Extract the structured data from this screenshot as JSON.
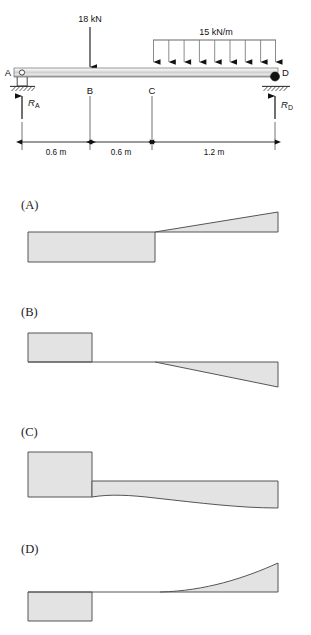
{
  "figure": {
    "type": "beam-shear-diagram-multiple-choice",
    "beam": {
      "nodes": [
        {
          "id": "A",
          "label": "A",
          "x_px": 16,
          "support": "pin"
        },
        {
          "id": "B",
          "label": "B",
          "x_px": 90,
          "support": "none"
        },
        {
          "id": "C",
          "label": "C",
          "x_px": 152,
          "support": "none"
        },
        {
          "id": "D",
          "label": "D",
          "x_px": 276,
          "support": "roller"
        }
      ],
      "loads": {
        "point_load": {
          "label": "18 kN",
          "magnitude": 18,
          "units": "kN",
          "at_node": "B",
          "direction": "down"
        },
        "distributed_load": {
          "label": "15 kN/m",
          "magnitude": 15,
          "units": "kN/m",
          "from_node": "C",
          "to_node": "D",
          "direction": "down",
          "arrow_count": 9
        }
      },
      "reactions": [
        {
          "label": "R",
          "subscript": "A",
          "at_node": "A",
          "direction": "up"
        },
        {
          "label": "R",
          "subscript": "D",
          "at_node": "D",
          "direction": "up"
        }
      ],
      "dimensions": [
        {
          "label": "0.6 m",
          "value": 0.6,
          "units": "m",
          "from": "A",
          "to": "B"
        },
        {
          "label": "0.6 m",
          "value": 0.6,
          "units": "m",
          "from": "B",
          "to": "C"
        },
        {
          "label": "1.2 m",
          "value": 1.2,
          "units": "m",
          "from": "C",
          "to": "D"
        }
      ]
    },
    "options": [
      {
        "id": "A",
        "label": "(A)",
        "description": "negative constant block then rising straight ramp positive",
        "segments": [
          {
            "shape": "rectangle",
            "side": "below",
            "from_px": 28,
            "to_px": 155
          },
          {
            "shape": "triangle-rising",
            "side": "above",
            "from_px": 155,
            "to_px": 278
          }
        ]
      },
      {
        "id": "B",
        "label": "(B)",
        "description": "positive constant block, zero segment, then falling straight ramp negative",
        "segments": [
          {
            "shape": "rectangle",
            "side": "above",
            "from_px": 28,
            "to_px": 92
          },
          {
            "shape": "zero",
            "side": "none",
            "from_px": 92,
            "to_px": 155
          },
          {
            "shape": "triangle-falling",
            "side": "below",
            "from_px": 155,
            "to_px": 278
          }
        ]
      },
      {
        "id": "C",
        "label": "(C)",
        "description": "positive block, step down to lower constant, then curved taper",
        "segments": [
          {
            "shape": "rectangle",
            "side": "above",
            "from_px": 28,
            "to_px": 92
          },
          {
            "shape": "curved-band",
            "side": "straddle",
            "from_px": 92,
            "to_px": 278
          }
        ]
      },
      {
        "id": "D",
        "label": "(D)",
        "description": "negative constant block, zero segment, then concave rising curve positive",
        "segments": [
          {
            "shape": "rectangle",
            "side": "below",
            "from_px": 28,
            "to_px": 92
          },
          {
            "shape": "zero",
            "side": "none",
            "from_px": 92,
            "to_px": 155
          },
          {
            "shape": "curve-rising",
            "side": "above",
            "from_px": 155,
            "to_px": 278
          }
        ]
      }
    ],
    "colors": {
      "fill": "#e3e3e3",
      "stroke": "#555555",
      "ink": "#111111",
      "beam_light": "#f2f2f2",
      "beam_mid": "#d9d9d9",
      "beam_dark": "#9a9a9a",
      "hatch": "#333333"
    }
  }
}
